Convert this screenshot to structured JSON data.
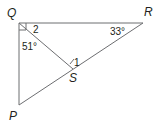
{
  "diagram": {
    "type": "geometry-triangle",
    "colors": {
      "line": "#6d6e71",
      "text": "#231f20",
      "background": "#ffffff"
    },
    "vertices": {
      "Q": {
        "label": "Q"
      },
      "R": {
        "label": "R"
      },
      "P": {
        "label": "P"
      },
      "S": {
        "label": "S"
      }
    },
    "angles": {
      "angle_R": "33°",
      "angle_PQS": "51°",
      "angle_2": "2",
      "angle_1": "1"
    },
    "segments": [
      "QR",
      "QP",
      "PR",
      "QS"
    ],
    "right_angle_at": "Q"
  }
}
